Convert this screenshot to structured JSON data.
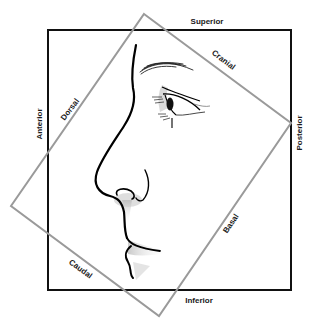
{
  "diagram": {
    "outer_frame_labels": {
      "top": "Superior",
      "bottom": "Inferior",
      "left": "Anterior",
      "right": "Posterior"
    },
    "rotated_frame_labels": {
      "upper_right": "Cranial",
      "upper_left": "Dorsal",
      "lower_right": "Basal",
      "lower_left": "Caudal"
    },
    "colors": {
      "outer_frame": "#111111",
      "rotated_frame": "#999999",
      "profile_line": "#000000",
      "shading": "#c8c8c8",
      "background": "#ffffff"
    }
  }
}
